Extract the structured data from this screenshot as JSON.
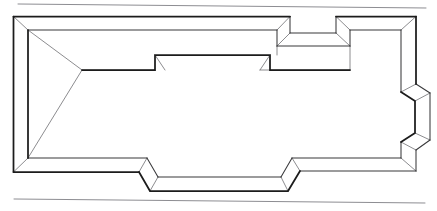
{
  "document": {
    "title": "Wall Layout Line Drawing",
    "description": "Hand-drawn perspective line drawing of a rectangular enclosure formed by low walls with rendered wall thickness, containing an inset notch along the upper run, two stepped recesses on the right-hand run, and two stepped offsets along the lower run.",
    "medium": "ink line drawing",
    "background_color": "#ffffff",
    "ink_color": "#1c1c1c",
    "rule_color": "#8d8d92",
    "width": 437,
    "height": 211
  },
  "figure": {
    "name": "walled-enclosure-perspective",
    "projection": "oblique perspective",
    "wall_count": 4,
    "rules": [
      {
        "name": "top-rule",
        "from": [
          18,
          4
        ],
        "to": [
          426,
          8
        ],
        "color": "#8d8d92"
      },
      {
        "name": "bottom-rule",
        "from": [
          14,
          199
        ],
        "to": [
          425,
          203
        ],
        "color": "#8d8d92"
      }
    ],
    "outlines": {
      "outer_boundary": "M 13.5,16.5 L 290,16.5 L 290,33 L 336,33 L 336,16.5 L 416,16.5 L 416,84 L 430,93 L 430,140 L 416,150 L 416,171 L 300,171 L 288,191 L 150,191 L 139,172 L 13.5,172 Z",
      "inner_boundary": "M 28,30 L 277,30 L 277,46 L 350,46 L 350,30 L 401,30 L 401,92 L 415,101 L 415,133 L 401,142 L 401,158 L 292,158 L 281,177 L 158,177 L 147,158 L 28,158 Z"
    },
    "strokes": {
      "heavy": [
        "M 13.5,16.5 L 13.5,172",
        "M 13.5,16.5 L 290,16.5",
        "M 13.5,172 L 139,172",
        "M 336,16.5 L 416,16.5",
        "M 416,16.5 L 416,84",
        "M 139,172 L 150,191 L 288,191 L 300,171",
        "M 28,30 L 28,158",
        "M 82,70 L 155,70 L 155,55 L 270,55 L 270,70 L 350,70",
        "M 401,92 L 415,101 L 415,133 L 401,142"
      ],
      "medium": [
        "M 28,30 L 277,30",
        "M 277,30 L 277,46",
        "M 277,46 L 350,46",
        "M 350,46 L 350,30",
        "M 350,30 L 401,30",
        "M 401,30 L 401,92",
        "M 401,142 L 401,158",
        "M 401,158 L 292,158",
        "M 292,158 L 281,177",
        "M 281,177 L 158,177",
        "M 158,177 L 147,158",
        "M 147,158 L 28,158",
        "M 290,16.5 L 290,33",
        "M 290,33 L 336,33",
        "M 336,33 L 336,16.5",
        "M 416,84 L 430,93",
        "M 430,93 L 430,140",
        "M 430,140 L 416,150",
        "M 416,150 L 416,171",
        "M 416,171 L 300,171"
      ],
      "connectors": [
        "M 13.5,16.5 L 28,30",
        "M 290,16.5 L 277,30",
        "M 290,33 L 277,46",
        "M 336,33 L 350,46",
        "M 336,16.5 L 350,30",
        "M 416,16.5 L 401,30",
        "M 416,84 L 401,92",
        "M 430,93 L 415,101",
        "M 430,140 L 415,133",
        "M 416,150 L 401,142",
        "M 416,171 L 401,158",
        "M 300,171 L 292,158",
        "M 288,191 L 281,177",
        "M 150,191 L 158,177",
        "M 139,172 L 147,158",
        "M 13.5,172 L 28,158",
        "M 82,70 L 28,30",
        "M 82,70 L 28,158"
      ],
      "interior_faces": [
        "M 155,55 L 165,70",
        "M 270,55 L 260,70",
        "M 82,70 L 155,70",
        "M 260,70 L 350,70",
        "M 350,46 L 350,70",
        "M 277,46 L 277,55"
      ]
    }
  }
}
